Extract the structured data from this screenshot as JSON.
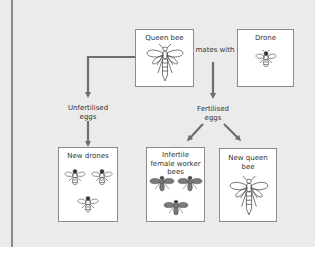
{
  "diagram": {
    "nodes": {
      "queen_bee": {
        "label": "Queen bee",
        "icon": "queen-bee-icon"
      },
      "drone": {
        "label": "Drone",
        "icon": "drone-bee-icon"
      },
      "new_drones": {
        "label": "New drones",
        "icon": "drone-bee-icon",
        "count": 3
      },
      "worker_bees": {
        "label": "Infertile female worker bees",
        "icon": "worker-bee-icon",
        "count": 3
      },
      "new_queen": {
        "label": "New queen bee",
        "icon": "queen-bee-icon"
      }
    },
    "labels": {
      "mates_with": "mates with",
      "unfertilised_eggs": "Unfertilised eggs",
      "fertilised_eggs": "Fertilised eggs"
    },
    "edges": [
      {
        "from": "queen_bee",
        "to": "unfertilised_eggs"
      },
      {
        "from": "unfertilised_eggs",
        "to": "new_drones"
      },
      {
        "from": "mates_with",
        "to": "fertilised_eggs"
      },
      {
        "from": "fertilised_eggs",
        "to": "worker_bees"
      },
      {
        "from": "fertilised_eggs",
        "to": "new_queen"
      }
    ],
    "colors": {
      "background": "#ebebeb",
      "arrow": "#6e6e6e",
      "box_border": "#8c8c8c",
      "worker_fill": "#7a7a7a"
    }
  }
}
